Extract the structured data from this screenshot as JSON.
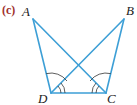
{
  "figure": {
    "part_label": "(c)",
    "colors": {
      "line": "#3d9fd6",
      "arc": "#333333",
      "part_label": "#a0302c"
    },
    "vertices": {
      "A": {
        "label": "A",
        "x": 33,
        "y": 19
      },
      "B": {
        "label": "B",
        "x": 124,
        "y": 19
      },
      "C": {
        "label": "C",
        "x": 106,
        "y": 93
      },
      "D": {
        "label": "D",
        "x": 51,
        "y": 93
      }
    },
    "segments": [
      "AD",
      "AC",
      "BD",
      "BC",
      "DC"
    ],
    "angle_marks": [
      {
        "vertex": "D",
        "angle": "ADC",
        "arcs": 1
      },
      {
        "vertex": "D",
        "angle": "BDC",
        "arcs": 2
      },
      {
        "vertex": "C",
        "angle": "BCD",
        "arcs": 1
      },
      {
        "vertex": "C",
        "angle": "ACD",
        "arcs": 2
      }
    ]
  }
}
